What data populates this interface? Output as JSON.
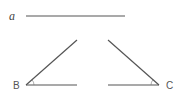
{
  "diagram": {
    "segment": {
      "label": "a"
    },
    "angle_left": {
      "vertex_label": "B"
    },
    "angle_right": {
      "vertex_label": "C"
    }
  }
}
